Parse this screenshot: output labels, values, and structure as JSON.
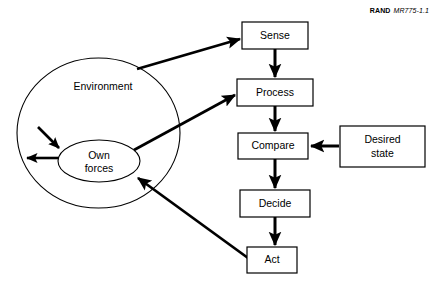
{
  "figure": {
    "credit_brand": "RAND",
    "credit_doc_id": "MR775-1.1",
    "background_color": "#ffffff",
    "stroke_color": "#000000"
  },
  "nodes": {
    "environment": {
      "label": "Environment",
      "shape": "ellipse",
      "cx": 98.5,
      "cy": 133,
      "rx": 81.5,
      "ry": 75,
      "label_x": 103,
      "label_y": 90
    },
    "own_forces": {
      "label_line1": "Own",
      "label_line2": "forces",
      "shape": "ellipse",
      "cx": 99,
      "cy": 161,
      "rx": 41,
      "ry": 21,
      "label_x": 99,
      "label_y1": 157,
      "label_y2": 170
    },
    "sense": {
      "label": "Sense",
      "shape": "rect",
      "x": 242,
      "y": 22,
      "w": 66,
      "h": 27
    },
    "process": {
      "label": "Process",
      "shape": "rect",
      "x": 237,
      "y": 79,
      "w": 76,
      "h": 27
    },
    "compare": {
      "label": "Compare",
      "shape": "rect",
      "x": 238,
      "y": 133,
      "w": 70,
      "h": 26
    },
    "decide": {
      "label": "Decide",
      "shape": "rect",
      "x": 240,
      "y": 190,
      "w": 70,
      "h": 27
    },
    "act": {
      "label": "Act",
      "shape": "rect",
      "x": 247,
      "y": 247,
      "w": 50,
      "h": 26
    },
    "desired_state": {
      "label_line1": "Desired",
      "label_line2": "state",
      "shape": "rect",
      "x": 340,
      "y": 126,
      "w": 85,
      "h": 41
    }
  },
  "edges": [
    {
      "name": "environment-to-sense",
      "from": "environment",
      "to": "sense"
    },
    {
      "name": "sense-to-process",
      "from": "sense",
      "to": "process"
    },
    {
      "name": "own-forces-to-process",
      "from": "own_forces",
      "to": "process"
    },
    {
      "name": "process-to-compare",
      "from": "process",
      "to": "compare"
    },
    {
      "name": "desired-state-to-compare",
      "from": "desired_state",
      "to": "compare"
    },
    {
      "name": "compare-to-decide",
      "from": "compare",
      "to": "decide"
    },
    {
      "name": "decide-to-act",
      "from": "decide",
      "to": "act"
    },
    {
      "name": "act-to-own-forces",
      "from": "act",
      "to": "own_forces"
    },
    {
      "name": "environment-into-own-forces",
      "from": "environment",
      "to": "own_forces"
    },
    {
      "name": "own-forces-out-to-environment",
      "from": "own_forces",
      "to": "environment"
    }
  ]
}
